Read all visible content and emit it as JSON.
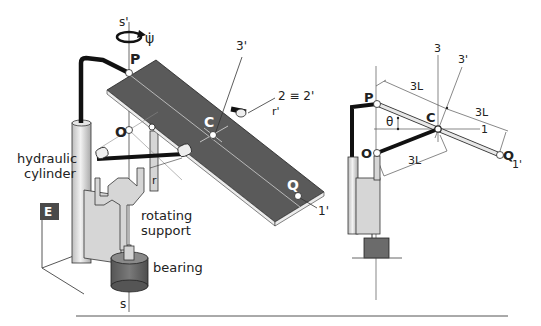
{
  "left_figure": {
    "axis_top": "s'",
    "axis_bottom": "s",
    "rotation_rate": "ψ̇",
    "point_p": "P",
    "point_o": "O",
    "point_c": "C",
    "point_q": "Q",
    "axis_3prime": "3'",
    "axis_2": "2 ≡ 2'",
    "link_rprime": "r'",
    "link_r": "r",
    "axis_1prime": "1'",
    "label_hydraulic_line1": "hydraulic",
    "label_hydraulic_line2": "cylinder",
    "label_rotating_line1": "rotating",
    "label_rotating_line2": "support",
    "label_bearing": "bearing",
    "frame_label": "E"
  },
  "right_figure": {
    "point_p": "P",
    "point_o": "O",
    "point_c": "C",
    "point_q": "Q",
    "axis_3": "3",
    "axis_3prime": "3'",
    "axis_1": "1",
    "axis_1prime": "1'",
    "angle": "θ",
    "dim_pc": "3L",
    "dim_cq": "3L",
    "dim_oc": "3L"
  },
  "colors": {
    "plate": "#5a5a5a",
    "plate_edge": "#e8e8e8",
    "support": "#d4d4d4",
    "bearing": "#6b6b6b",
    "link": "#111111",
    "frame_box": "#4a4a4a"
  }
}
